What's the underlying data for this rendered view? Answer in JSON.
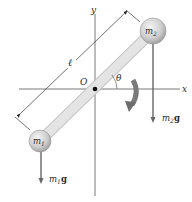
{
  "diagram": {
    "axes": {
      "x_label": "x",
      "y_label": "y",
      "origin_label": "O"
    },
    "rod": {
      "length_label": "ℓ",
      "angle_label": "θ"
    },
    "masses": [
      {
        "id": "m1",
        "label_main": "m",
        "label_sub": "1",
        "force_main": "m",
        "force_sub": "1",
        "force_g": "g"
      },
      {
        "id": "m2",
        "label_main": "m",
        "label_sub": "2",
        "force_main": "m",
        "force_sub": "2",
        "force_g": "g"
      }
    ],
    "colors": {
      "axis": "#555555",
      "rod": "#e4e4e4",
      "ball": "#c8c8c8",
      "force_arrow": "#666666",
      "rotation_arrow": "#777777",
      "dimension_line": "#333333"
    }
  }
}
